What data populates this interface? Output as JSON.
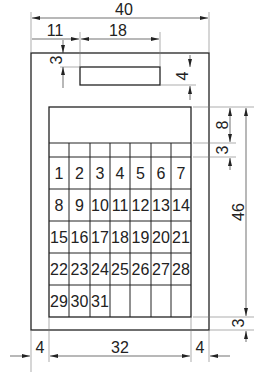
{
  "drawing": {
    "description": "Dimensioned drawing of a wall calendar",
    "dimensions": {
      "overall_width": "40",
      "display_offset_left": "11",
      "display_width": "18",
      "display_offset_top": "3",
      "display_height": "4",
      "header_height": "8",
      "weekday_row_height": "3",
      "calendar_height": "46",
      "bottom_margin": "3",
      "left_margin": "4",
      "calendar_width": "32",
      "right_margin": "4"
    },
    "calendar": {
      "rows": [
        [
          "1",
          "2",
          "3",
          "4",
          "5",
          "6",
          "7"
        ],
        [
          "8",
          "9",
          "10",
          "11",
          "12",
          "13",
          "14"
        ],
        [
          "15",
          "16",
          "17",
          "18",
          "19",
          "20",
          "21"
        ],
        [
          "22",
          "23",
          "24",
          "25",
          "26",
          "27",
          "28"
        ],
        [
          "29",
          "30",
          "31",
          "",
          "",
          "",
          ""
        ]
      ]
    }
  }
}
